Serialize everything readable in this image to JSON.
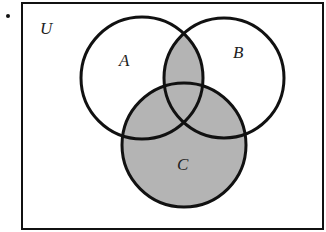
{
  "diagram": {
    "type": "venn-diagram",
    "bullet": "•",
    "universe_label": "U",
    "sets": [
      {
        "label": "A",
        "shaded_region": false
      },
      {
        "label": "B",
        "shaded_region": false
      },
      {
        "label": "C",
        "shaded_region": true
      }
    ],
    "shaded": "(A ∩ B) ∪ C",
    "colors": {
      "shade": "#b4b4b4",
      "stroke": "#111111",
      "background": "#ffffff"
    }
  }
}
